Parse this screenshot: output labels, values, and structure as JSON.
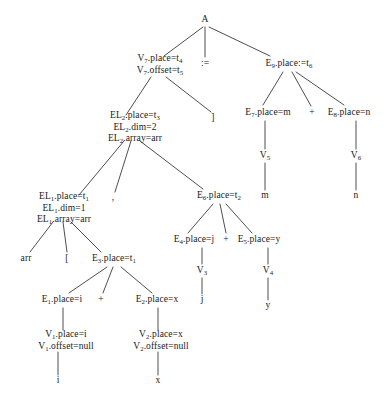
{
  "diagram": {
    "type": "parse-tree",
    "width": 390,
    "height": 410,
    "background": "#ffffff",
    "text_color": "#1a1a1a",
    "edge_color": "#3a3a3a"
  },
  "nodes": [
    {
      "id": "A",
      "x": 205,
      "y": 20,
      "lines": [
        "A"
      ]
    },
    {
      "id": "V7",
      "x": 160,
      "y": 64,
      "lines": [
        "V<sub>7</sub>.place=t<sub>4</sub>",
        "V<sub>7</sub>.offset=t<sub>5</sub>"
      ]
    },
    {
      "id": "assign",
      "x": 205,
      "y": 64,
      "lines": [
        ":="
      ]
    },
    {
      "id": "E9",
      "x": 289,
      "y": 64,
      "lines": [
        "E<sub>9</sub>.place:=t<sub>6</sub>"
      ]
    },
    {
      "id": "EL2",
      "x": 135,
      "y": 127,
      "lines": [
        "EL<sub>2</sub>.place=t<sub>3</sub>",
        "EL<sub>2</sub>.dim=2",
        "EL<sub>2</sub>.array=arr"
      ]
    },
    {
      "id": "rbracket",
      "x": 213,
      "y": 118,
      "lines": [
        "]"
      ]
    },
    {
      "id": "E7",
      "x": 268,
      "y": 113,
      "lines": [
        "E<sub>7</sub>.place=m"
      ]
    },
    {
      "id": "plus_top",
      "x": 312,
      "y": 113,
      "lines": [
        "+"
      ]
    },
    {
      "id": "E8",
      "x": 349,
      "y": 113,
      "lines": [
        "E<sub>8</sub>.place=n"
      ]
    },
    {
      "id": "V5",
      "x": 265,
      "y": 156,
      "lines": [
        "V<sub>5</sub>"
      ]
    },
    {
      "id": "V6",
      "x": 356,
      "y": 156,
      "lines": [
        "V<sub>6</sub>"
      ]
    },
    {
      "id": "EL1",
      "x": 64,
      "y": 208,
      "lines": [
        "EL<sub>1</sub>.place=t<sub>1</sub>",
        "EL<sub>1</sub>.dim=1",
        "EL<sub>1</sub>.array=arr"
      ]
    },
    {
      "id": "comma",
      "x": 113,
      "y": 198,
      "lines": [
        ","
      ]
    },
    {
      "id": "E6",
      "x": 219,
      "y": 196,
      "lines": [
        "E<sub>6</sub>.place=t<sub>2</sub>"
      ]
    },
    {
      "id": "m_leaf",
      "x": 265,
      "y": 196,
      "lines": [
        "m"
      ]
    },
    {
      "id": "n_leaf",
      "x": 356,
      "y": 196,
      "lines": [
        "n"
      ]
    },
    {
      "id": "arr_leaf",
      "x": 26,
      "y": 259,
      "lines": [
        "arr"
      ]
    },
    {
      "id": "lbracket",
      "x": 67,
      "y": 259,
      "lines": [
        "["
      ]
    },
    {
      "id": "E3",
      "x": 114,
      "y": 259,
      "lines": [
        "E<sub>3</sub>.place=t<sub>1</sub>"
      ]
    },
    {
      "id": "E4",
      "x": 194,
      "y": 240,
      "lines": [
        "E<sub>4</sub>.place=j"
      ]
    },
    {
      "id": "plus_mid",
      "x": 226,
      "y": 240,
      "lines": [
        "+"
      ]
    },
    {
      "id": "E5",
      "x": 259,
      "y": 240,
      "lines": [
        "E<sub>5</sub>.place=y"
      ]
    },
    {
      "id": "V3",
      "x": 202,
      "y": 271,
      "lines": [
        "V<sub>3</sub>"
      ]
    },
    {
      "id": "V4",
      "x": 268,
      "y": 271,
      "lines": [
        "V<sub>4</sub>"
      ]
    },
    {
      "id": "E1",
      "x": 62,
      "y": 300,
      "lines": [
        "E<sub>1</sub>.place=i"
      ]
    },
    {
      "id": "plus_low",
      "x": 101,
      "y": 300,
      "lines": [
        "+"
      ]
    },
    {
      "id": "E2",
      "x": 157,
      "y": 300,
      "lines": [
        "E<sub>2</sub>.place=x"
      ]
    },
    {
      "id": "j_leaf",
      "x": 202,
      "y": 300,
      "lines": [
        "j"
      ]
    },
    {
      "id": "y_leaf",
      "x": 268,
      "y": 306,
      "lines": [
        "y"
      ]
    },
    {
      "id": "V1",
      "x": 66,
      "y": 340,
      "lines": [
        "V<sub>1</sub>.place=i",
        "V<sub>1</sub>.offset=null"
      ]
    },
    {
      "id": "V2",
      "x": 161,
      "y": 340,
      "lines": [
        "V<sub>2</sub>.place=x",
        "V<sub>2</sub>.offset=null"
      ]
    },
    {
      "id": "i_leaf",
      "x": 58,
      "y": 381,
      "lines": [
        "i"
      ]
    },
    {
      "id": "x_leaf",
      "x": 158,
      "y": 381,
      "lines": [
        "x"
      ]
    }
  ],
  "edges": [
    {
      "from": "A",
      "to": "V7",
      "x1": 203,
      "y1": 27,
      "x2": 164,
      "y2": 56
    },
    {
      "from": "A",
      "to": "assign",
      "x1": 205,
      "y1": 27,
      "x2": 205,
      "y2": 57
    },
    {
      "from": "A",
      "to": "E9",
      "x1": 209,
      "y1": 27,
      "x2": 270,
      "y2": 56
    },
    {
      "from": "V7",
      "to": "EL2",
      "x1": 151,
      "y1": 77,
      "x2": 126,
      "y2": 115
    },
    {
      "from": "V7",
      "to": "rbracket",
      "x1": 166,
      "y1": 77,
      "x2": 211,
      "y2": 112
    },
    {
      "from": "E9",
      "to": "E7",
      "x1": 283,
      "y1": 72,
      "x2": 263,
      "y2": 105
    },
    {
      "from": "E9",
      "to": "plus_top",
      "x1": 292,
      "y1": 72,
      "x2": 311,
      "y2": 106
    },
    {
      "from": "E9",
      "to": "E8",
      "x1": 296,
      "y1": 72,
      "x2": 344,
      "y2": 105
    },
    {
      "from": "E7",
      "to": "V5",
      "x1": 265,
      "y1": 121,
      "x2": 265,
      "y2": 149
    },
    {
      "from": "E8",
      "to": "V6",
      "x1": 356,
      "y1": 121,
      "x2": 356,
      "y2": 149
    },
    {
      "from": "V5",
      "to": "m_leaf",
      "x1": 265,
      "y1": 163,
      "x2": 265,
      "y2": 190
    },
    {
      "from": "V6",
      "to": "n_leaf",
      "x1": 356,
      "y1": 163,
      "x2": 356,
      "y2": 190
    },
    {
      "from": "EL2",
      "to": "EL1",
      "x1": 124,
      "y1": 141,
      "x2": 79,
      "y2": 195
    },
    {
      "from": "EL2",
      "to": "comma",
      "x1": 131,
      "y1": 141,
      "x2": 115,
      "y2": 192
    },
    {
      "from": "EL2",
      "to": "E6",
      "x1": 140,
      "y1": 141,
      "x2": 203,
      "y2": 189
    },
    {
      "from": "EL1",
      "to": "arr_leaf",
      "x1": 53,
      "y1": 222,
      "x2": 30,
      "y2": 252
    },
    {
      "from": "EL1",
      "to": "lbracket",
      "x1": 63,
      "y1": 222,
      "x2": 67,
      "y2": 252
    },
    {
      "from": "EL1",
      "to": "E3",
      "x1": 71,
      "y1": 222,
      "x2": 101,
      "y2": 252
    },
    {
      "from": "E3",
      "to": "E1",
      "x1": 107,
      "y1": 267,
      "x2": 69,
      "y2": 293
    },
    {
      "from": "E3",
      "to": "plus_low",
      "x1": 113,
      "y1": 267,
      "x2": 103,
      "y2": 293
    },
    {
      "from": "E3",
      "to": "E2",
      "x1": 121,
      "y1": 267,
      "x2": 152,
      "y2": 293
    },
    {
      "from": "E1",
      "to": "V1",
      "x1": 63,
      "y1": 308,
      "x2": 63,
      "y2": 330
    },
    {
      "from": "E2",
      "to": "V2",
      "x1": 158,
      "y1": 308,
      "x2": 158,
      "y2": 330
    },
    {
      "from": "V1",
      "to": "i_leaf",
      "x1": 58,
      "y1": 352,
      "x2": 58,
      "y2": 375
    },
    {
      "from": "V2",
      "to": "x_leaf",
      "x1": 158,
      "y1": 352,
      "x2": 158,
      "y2": 375
    },
    {
      "from": "E6",
      "to": "E4",
      "x1": 213,
      "y1": 204,
      "x2": 188,
      "y2": 233
    },
    {
      "from": "E6",
      "to": "plus_mid",
      "x1": 220,
      "y1": 204,
      "x2": 226,
      "y2": 233
    },
    {
      "from": "E6",
      "to": "E5",
      "x1": 226,
      "y1": 204,
      "x2": 252,
      "y2": 233
    },
    {
      "from": "E4",
      "to": "V3",
      "x1": 202,
      "y1": 248,
      "x2": 202,
      "y2": 264
    },
    {
      "from": "E5",
      "to": "V4",
      "x1": 268,
      "y1": 248,
      "x2": 268,
      "y2": 264
    },
    {
      "from": "V3",
      "to": "j_leaf",
      "x1": 202,
      "y1": 278,
      "x2": 202,
      "y2": 294
    },
    {
      "from": "V4",
      "to": "y_leaf",
      "x1": 268,
      "y1": 278,
      "x2": 268,
      "y2": 300
    }
  ]
}
